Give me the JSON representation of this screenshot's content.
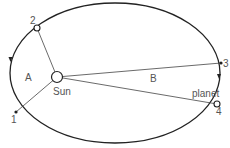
{
  "diagram": {
    "colors": {
      "orbit": "#222222",
      "line": "#444444",
      "text": "#555555",
      "background": "#ffffff"
    },
    "orbit": {
      "cx": 115,
      "cy": 73,
      "rx": 105,
      "ry": 70
    },
    "sun": {
      "label": "Sun",
      "x": 57,
      "y": 77
    },
    "areas": [
      {
        "label": "A",
        "x": 28,
        "y": 77
      },
      {
        "label": "B",
        "x": 153,
        "y": 79
      }
    ],
    "points": [
      {
        "id": "1",
        "label": "1",
        "x": 16,
        "y": 112,
        "marker": "dot"
      },
      {
        "id": "2",
        "label": "2",
        "x": 37,
        "y": 28,
        "marker": "circle"
      },
      {
        "id": "3",
        "label": "3",
        "x": 221,
        "y": 63,
        "marker": "dot"
      },
      {
        "id": "4",
        "label": "4",
        "x": 217,
        "y": 104,
        "marker": "circle"
      }
    ],
    "planet_label": "planet"
  }
}
